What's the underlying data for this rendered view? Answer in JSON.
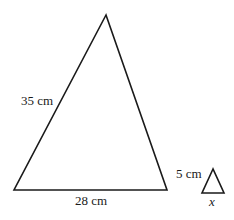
{
  "diagram": {
    "type": "similar-triangles",
    "large_triangle": {
      "vertices": {
        "apex": [
          106,
          15
        ],
        "bottom_left": [
          14,
          190
        ],
        "bottom_right": [
          167,
          190
        ]
      },
      "labels": {
        "left_side": "35 cm",
        "base": "28 cm"
      }
    },
    "small_triangle": {
      "vertices": {
        "apex": [
          213,
          169
        ],
        "bottom_left": [
          202,
          193
        ],
        "bottom_right": [
          224,
          193
        ]
      },
      "labels": {
        "left_side": "5 cm",
        "base": "x"
      }
    },
    "colors": {
      "stroke": "#1a1a1a",
      "background": "#ffffff"
    }
  }
}
